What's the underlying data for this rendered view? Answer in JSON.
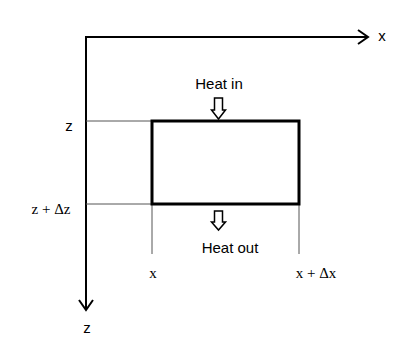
{
  "diagram": {
    "type": "control-volume heat balance",
    "axes": {
      "x_label": "x",
      "z_label": "z"
    },
    "labels": {
      "heat_in": "Heat in",
      "heat_out": "Heat out",
      "z_top": "z",
      "z_bottom": "z + Δz",
      "x_left": "x",
      "x_right": "x + Δx"
    },
    "colors": {
      "line": "#000000",
      "guide": "#555555",
      "background": "#ffffff"
    }
  }
}
